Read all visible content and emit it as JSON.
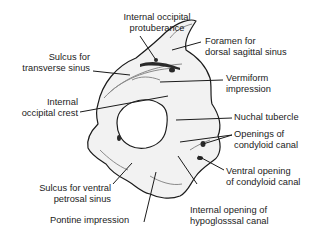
{
  "diagram": {
    "labels": {
      "internal_occipital_protuberance_1": "Internal occipital",
      "internal_occipital_protuberance_2": "protuberance",
      "foramen_dorsal_sagittal_1": "Foramen for",
      "foramen_dorsal_sagittal_2": "dorsal sagittal sinus",
      "sulcus_transverse_1": "Sulcus for",
      "sulcus_transverse_2": "transverse sinus",
      "vermiform_1": "Vermiform",
      "vermiform_2": "impression",
      "internal_occipital_crest_1": "Internal",
      "internal_occipital_crest_2": "occipital crest",
      "nuchal_tubercle": "Nuchal tubercle",
      "openings_condyloid_1": "Openings of",
      "openings_condyloid_2": "condyloid canal",
      "ventral_opening_condyloid_1": "Ventral opening",
      "ventral_opening_condyloid_2": "of condyloid canal",
      "sulcus_ventral_petrosal_1": "Sulcus for ventral",
      "sulcus_ventral_petrosal_2": "petrosal sinus",
      "pontine_impression": "Pontine impression",
      "internal_opening_hypoglossal_1": "Internal opening of",
      "internal_opening_hypoglossal_2": "hypoglosssal canal"
    },
    "colors": {
      "ink": "#1b1b1b",
      "bone_fill": "#f2f2f2",
      "shade": "#9a9a9a",
      "background": "#ffffff"
    }
  }
}
